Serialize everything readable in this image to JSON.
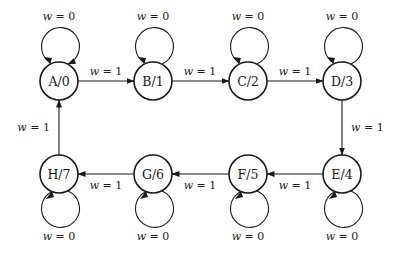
{
  "diagram": {
    "type": "state-machine",
    "states": [
      {
        "id": "A",
        "label": "A/0",
        "cx": 59,
        "cy": 81,
        "loop": "top"
      },
      {
        "id": "B",
        "label": "B/1",
        "cx": 153,
        "cy": 81,
        "loop": "top"
      },
      {
        "id": "C",
        "label": "C/2",
        "cx": 248,
        "cy": 81,
        "loop": "top"
      },
      {
        "id": "D",
        "label": "D/3",
        "cx": 342,
        "cy": 81,
        "loop": "top"
      },
      {
        "id": "E",
        "label": "E/4",
        "cx": 342,
        "cy": 174,
        "loop": "bottom"
      },
      {
        "id": "F",
        "label": "F/5",
        "cx": 248,
        "cy": 174,
        "loop": "bottom"
      },
      {
        "id": "G",
        "label": "G/6",
        "cx": 153,
        "cy": 174,
        "loop": "bottom"
      },
      {
        "id": "H",
        "label": "H/7",
        "cx": 59,
        "cy": 174,
        "loop": "bottom"
      }
    ],
    "self_loop_label": {
      "var": "w",
      "eq": " = 0"
    },
    "transitions": [
      {
        "from": "A",
        "to": "B",
        "var": "w",
        "eq": " = 1"
      },
      {
        "from": "B",
        "to": "C",
        "var": "w",
        "eq": " = 1"
      },
      {
        "from": "C",
        "to": "D",
        "var": "w",
        "eq": " = 1"
      },
      {
        "from": "D",
        "to": "E",
        "var": "w",
        "eq": " = 1"
      },
      {
        "from": "E",
        "to": "F",
        "var": "w",
        "eq": " = 1"
      },
      {
        "from": "F",
        "to": "G",
        "var": "w",
        "eq": " = 1"
      },
      {
        "from": "G",
        "to": "H",
        "var": "w",
        "eq": " = 1"
      },
      {
        "from": "H",
        "to": "A",
        "var": "w",
        "eq": " = 1"
      }
    ],
    "self_loops": [
      {
        "state": "A",
        "var": "w",
        "eq": " = 0"
      },
      {
        "state": "B",
        "var": "w",
        "eq": " = 0"
      },
      {
        "state": "C",
        "var": "w",
        "eq": " = 0"
      },
      {
        "state": "D",
        "var": "w",
        "eq": " = 0"
      },
      {
        "state": "E",
        "var": "w",
        "eq": " = 0"
      },
      {
        "state": "F",
        "var": "w",
        "eq": " = 0"
      },
      {
        "state": "G",
        "var": "w",
        "eq": " = 0"
      },
      {
        "state": "H",
        "var": "w",
        "eq": " = 0"
      }
    ],
    "colors": {
      "stroke": "#1a1a1a",
      "background": "#ffffff"
    }
  }
}
